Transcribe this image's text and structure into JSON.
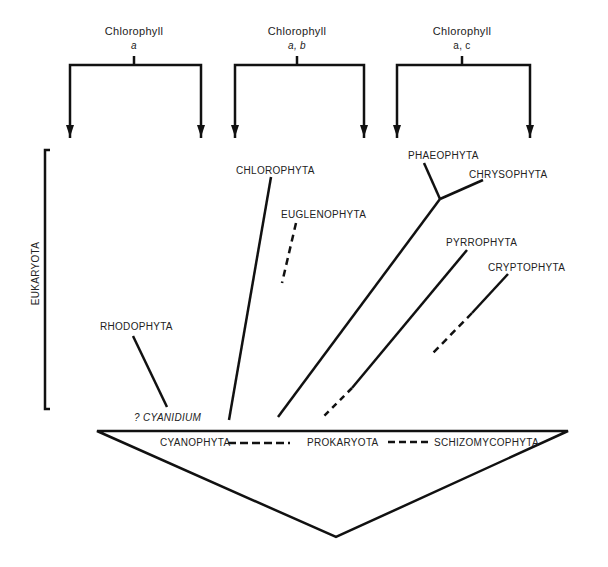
{
  "headers": [
    {
      "title": "Chlorophyll",
      "pigments": "a"
    },
    {
      "title": "Chlorophyll",
      "pigments": "a, b"
    },
    {
      "title": "Chlorophyll",
      "pigments": "a, c"
    }
  ],
  "bracket": {
    "label": "EUKARYOTA"
  },
  "taxa": {
    "rhodophyta": "RHODOPHYTA",
    "cyanidium": "? CYANIDIUM",
    "chlorophyta": "CHLOROPHYTA",
    "euglenophyta": "EUGLENOPHYTA",
    "phaeophyta": "PHAEOPHYTA",
    "chrysophyta": "CHRYSOPHYTA",
    "pyrrophyta": "PYRROPHYTA",
    "cryptophyta": "CRYPTOPHYTA"
  },
  "base": {
    "cyanophyta": "CYANOPHYTA",
    "prokaryota": "PROKARYOTA",
    "schizomycophyta": "SCHIZOMYCOPHYTA"
  },
  "colors": {
    "line": "#111111",
    "text": "#222222",
    "background": "#ffffff"
  }
}
